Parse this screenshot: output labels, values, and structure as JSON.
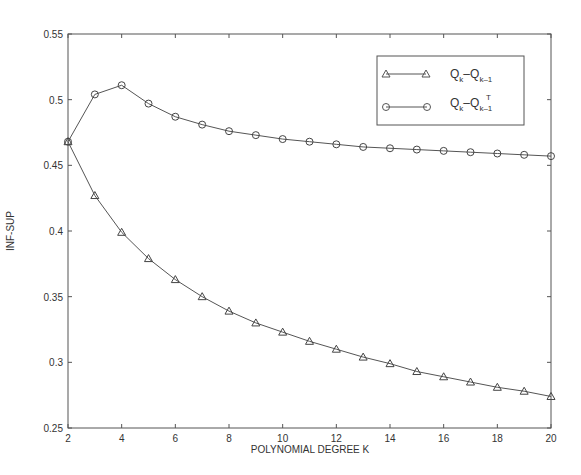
{
  "chart_data": {
    "type": "line",
    "title": "",
    "xlabel": "POLYNOMIAL DEGREE K",
    "ylabel": "INF-SUP",
    "xlim": [
      2,
      20
    ],
    "ylim": [
      0.25,
      0.55
    ],
    "x_ticks": [
      "2",
      "4",
      "6",
      "8",
      "10",
      "12",
      "14",
      "16",
      "18",
      "20"
    ],
    "y_ticks": [
      "0.25",
      "0.3",
      "0.35",
      "0.4",
      "0.45",
      "0.5",
      "0.55"
    ],
    "grid": false,
    "legend_position": "upper right",
    "x": [
      2,
      3,
      4,
      5,
      6,
      7,
      8,
      9,
      10,
      11,
      12,
      13,
      14,
      15,
      16,
      17,
      18,
      19,
      20
    ],
    "series": [
      {
        "name": "Q_k - Q_{k-1}",
        "marker": "triangle",
        "values": [
          0.468,
          0.427,
          0.399,
          0.379,
          0.363,
          0.35,
          0.339,
          0.33,
          0.323,
          0.316,
          0.31,
          0.304,
          0.299,
          0.293,
          0.289,
          0.285,
          0.281,
          0.278,
          0.274
        ]
      },
      {
        "name": "Q_k - Q^T_{k-1}",
        "marker": "circle",
        "values": [
          0.468,
          0.504,
          0.511,
          0.497,
          0.487,
          0.481,
          0.476,
          0.473,
          0.47,
          0.468,
          0.466,
          0.464,
          0.463,
          0.462,
          0.461,
          0.46,
          0.459,
          0.458,
          0.457
        ]
      }
    ]
  },
  "legend": {
    "s1_main": "Q",
    "s1_sub1": "k",
    "s1_dash": "–",
    "s1_main2": "Q",
    "s1_sub2": "k–1",
    "s2_main": "Q",
    "s2_sub1": "k",
    "s2_dash": "–",
    "s2_main2": "Q",
    "s2_sub2": "k–1",
    "s2_sup": "T"
  }
}
